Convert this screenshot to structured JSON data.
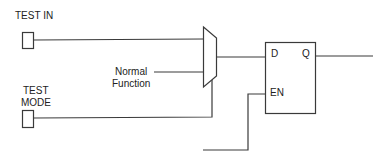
{
  "diagram": {
    "type": "circuit-schematic",
    "inputs": [
      {
        "id": "test_in",
        "label_lines": [
          "TEST IN"
        ]
      },
      {
        "id": "test_mode",
        "label_lines": [
          "TEST",
          "MODE"
        ]
      }
    ],
    "normal_function": {
      "label_lines": [
        "Normal",
        "Function"
      ]
    },
    "mux": {
      "label": ""
    },
    "flip_flop": {
      "pins": {
        "d": "D",
        "q": "Q",
        "en": "EN"
      }
    },
    "colors": {
      "line": "#3a3a3a",
      "text": "#222222",
      "background": "#ffffff"
    }
  }
}
